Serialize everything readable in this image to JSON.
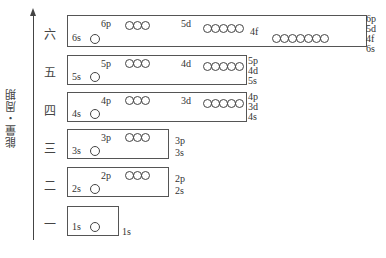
{
  "diagram": {
    "axis_label": "能量・周期",
    "periods": [
      {
        "name": "一",
        "s": "1s",
        "p": null,
        "d": null,
        "f": null,
        "right": [
          "1s"
        ]
      },
      {
        "name": "二",
        "s": "2s",
        "p": "2p",
        "d": null,
        "f": null,
        "right": [
          "2p",
          "2s"
        ]
      },
      {
        "name": "三",
        "s": "3s",
        "p": "3p",
        "d": null,
        "f": null,
        "right": [
          "3p",
          "3s"
        ]
      },
      {
        "name": "四",
        "s": "4s",
        "p": "4p",
        "d": "3d",
        "f": null,
        "right": [
          "4p",
          "3d",
          "4s"
        ]
      },
      {
        "name": "五",
        "s": "5s",
        "p": "5p",
        "d": "4d",
        "f": null,
        "right": [
          "5p",
          "4d",
          "5s"
        ]
      },
      {
        "name": "六",
        "s": "6s",
        "p": "6p",
        "d": "5d",
        "f": "4f",
        "right": [
          "6p",
          "5d",
          "4f",
          "6s"
        ]
      }
    ],
    "orbital_counts": {
      "s": 1,
      "p": 3,
      "d": 5,
      "f": 7
    }
  }
}
